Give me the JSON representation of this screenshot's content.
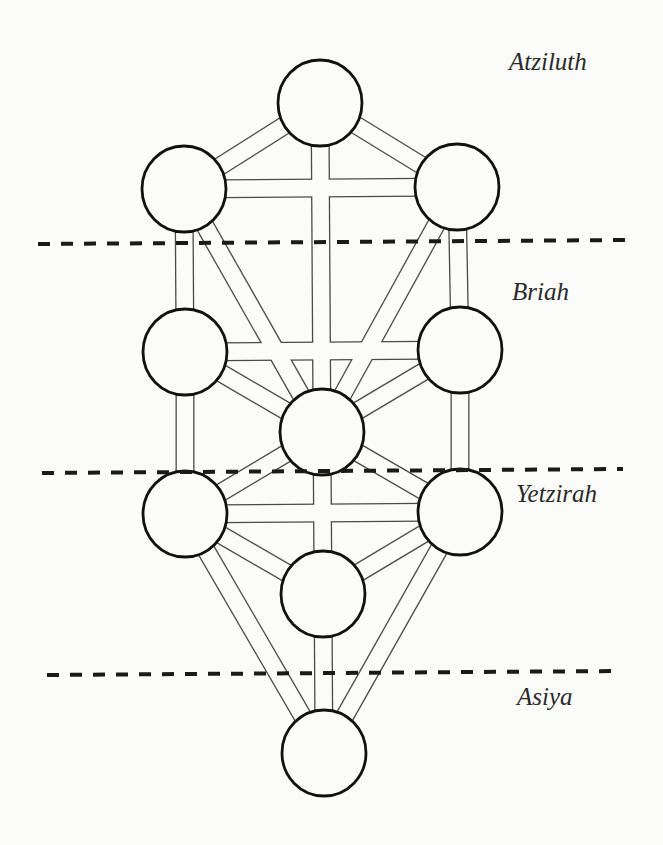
{
  "diagram": {
    "worlds": [
      {
        "id": "atziluth",
        "label": "Atziluth"
      },
      {
        "id": "briah",
        "label": "Briah"
      },
      {
        "id": "yetzirah",
        "label": "Yetzirah"
      },
      {
        "id": "asiya",
        "label": "Asiya"
      }
    ],
    "dividers": [
      {
        "between": [
          "atziluth",
          "briah"
        ]
      },
      {
        "between": [
          "briah",
          "yetzirah"
        ]
      },
      {
        "between": [
          "yetzirah",
          "asiya"
        ]
      }
    ],
    "sephirot": [
      {
        "id": "kether",
        "label": ""
      },
      {
        "id": "chokmah",
        "label": ""
      },
      {
        "id": "binah",
        "label": ""
      },
      {
        "id": "chesed",
        "label": ""
      },
      {
        "id": "geburah",
        "label": ""
      },
      {
        "id": "tiferet",
        "label": ""
      },
      {
        "id": "netzach",
        "label": ""
      },
      {
        "id": "hod",
        "label": ""
      },
      {
        "id": "yesod",
        "label": ""
      },
      {
        "id": "malkuth",
        "label": ""
      }
    ],
    "paths": [
      [
        "kether",
        "chokmah"
      ],
      [
        "kether",
        "binah"
      ],
      [
        "kether",
        "tiferet"
      ],
      [
        "chokmah",
        "binah"
      ],
      [
        "chokmah",
        "tiferet"
      ],
      [
        "chokmah",
        "chesed"
      ],
      [
        "binah",
        "tiferet"
      ],
      [
        "binah",
        "geburah"
      ],
      [
        "chesed",
        "geburah"
      ],
      [
        "chesed",
        "tiferet"
      ],
      [
        "chesed",
        "netzach"
      ],
      [
        "geburah",
        "tiferet"
      ],
      [
        "geburah",
        "hod"
      ],
      [
        "tiferet",
        "netzach"
      ],
      [
        "tiferet",
        "hod"
      ],
      [
        "tiferet",
        "yesod"
      ],
      [
        "netzach",
        "hod"
      ],
      [
        "netzach",
        "yesod"
      ],
      [
        "netzach",
        "malkuth"
      ],
      [
        "hod",
        "yesod"
      ],
      [
        "hod",
        "malkuth"
      ],
      [
        "yesod",
        "malkuth"
      ]
    ]
  }
}
